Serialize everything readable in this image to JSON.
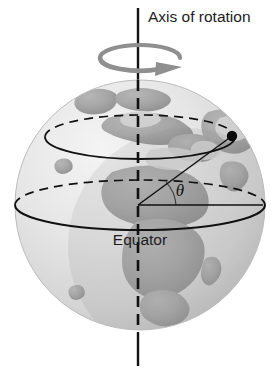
{
  "figure": {
    "background_color": "#ffffff"
  },
  "labels": {
    "axis_of_rotation": "Axis of rotation",
    "equator": "Equator",
    "theta": "θ"
  },
  "colors": {
    "ocean": "#e9e9e9",
    "ocean_shadow": "#c9c9c9",
    "land": "#a9a9a9",
    "land_light": "#bfbfbf",
    "outline": "#111111",
    "rotation_arrow": "#8a8a8a",
    "text": "#1c1c1c"
  },
  "geometry": {
    "globe_center_x": 140,
    "globe_center_y": 205,
    "globe_radius": 125,
    "axis_x": 138,
    "axis_top_y": 8,
    "axis_bottom_y": 366,
    "equator_center_y": 205,
    "equator_rx": 125,
    "equator_ry": 25,
    "latitude_center_y": 137,
    "latitude_rx": 95,
    "latitude_ry": 22,
    "point_x": 232,
    "point_y": 136,
    "point_radius": 5,
    "theta_label_x": 180,
    "theta_label_y": 194,
    "rotation_arrow_cx": 140,
    "rotation_arrow_cy": 58,
    "rotation_arrow_rx": 40,
    "rotation_arrow_ry": 13
  },
  "annotations": {
    "axis_label_x": 148,
    "axis_label_y": 22,
    "equator_label_x": 140,
    "equator_label_y": 245
  }
}
